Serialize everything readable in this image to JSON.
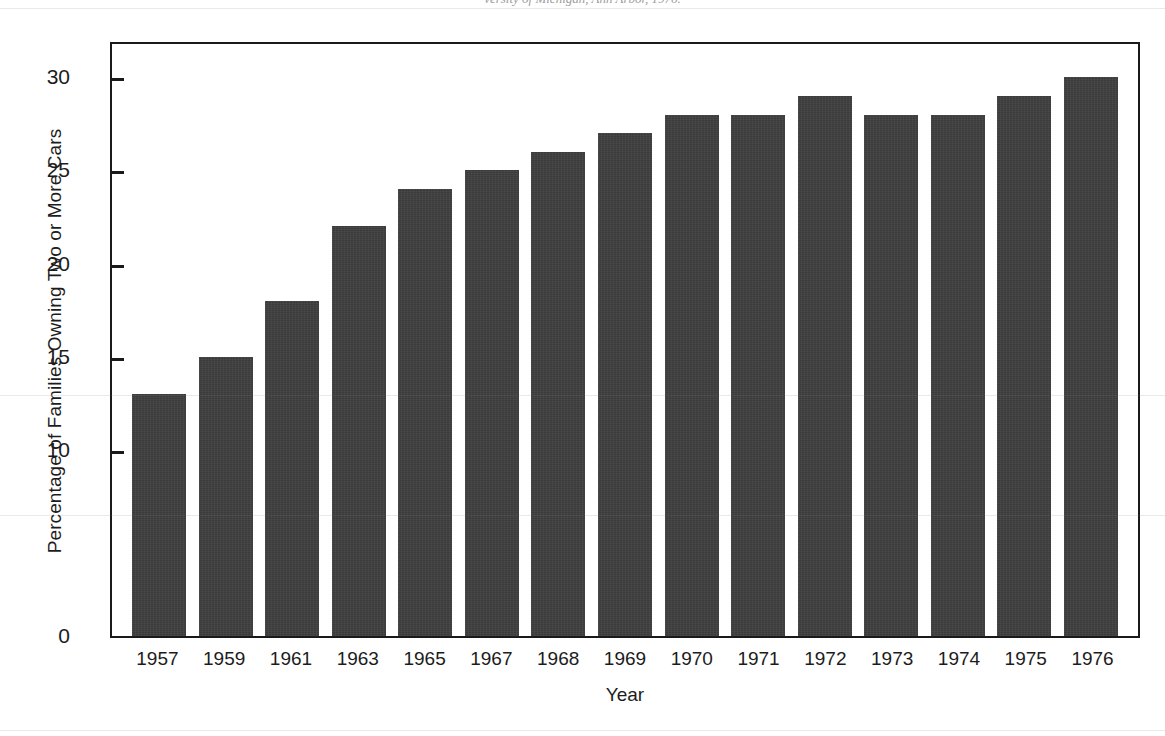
{
  "caption": {
    "clipped_source_line": "versity of Michigan, Ann Arbor, 1976."
  },
  "chart_data": {
    "type": "bar",
    "title": "",
    "xlabel": "Year",
    "ylabel": "Percentage of Families Owning Two or More Cars",
    "categories": [
      "1957",
      "1959",
      "1961",
      "1963",
      "1965",
      "1967",
      "1968",
      "1969",
      "1970",
      "1971",
      "1972",
      "1973",
      "1974",
      "1975",
      "1976"
    ],
    "values": [
      13,
      15,
      18,
      22,
      24,
      25,
      26,
      27,
      28,
      28,
      29,
      28,
      28,
      29,
      30
    ],
    "ylim": [
      0,
      32
    ],
    "ytick_values": [
      0,
      10,
      15,
      20,
      25,
      30
    ],
    "ytick_labels": [
      "0",
      "10",
      "15",
      "20",
      "25",
      "30"
    ],
    "grid": false,
    "legend": false,
    "bar_color": "#3b3b3b",
    "axis_color": "#1a1a1a",
    "background_color": "#ffffff"
  }
}
